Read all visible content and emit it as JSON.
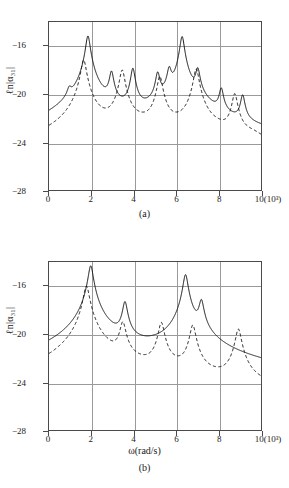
{
  "figure": {
    "ylabel": "ℓn|α₃₁|",
    "xlabel": "ω(rad/s)",
    "xtick_suffix": "(10³)"
  },
  "panels": [
    {
      "caption": "(a)",
      "show_xlabel": false
    },
    {
      "caption": "(b)",
      "show_xlabel": true
    }
  ],
  "axis": {
    "xticks": [
      "0",
      "2",
      "4",
      "6",
      "8",
      "10"
    ],
    "xtick_values": [
      0,
      2,
      4,
      6,
      8,
      10
    ],
    "yticks": [
      "−16",
      "−20",
      "−24",
      "−28"
    ],
    "ytick_values": [
      -16,
      -20,
      -24,
      -28
    ],
    "xlim": [
      0,
      10
    ],
    "ylim": [
      -28,
      -14.6
    ],
    "grid": true
  },
  "chart_data": {
    "type": "line",
    "title": "",
    "xlabel": "ω(rad/s)",
    "ylabel": "ℓn|α₃₁|",
    "xlim": [
      0,
      10
    ],
    "ylim": [
      -28,
      -14.6
    ],
    "x_unit_scale": "10^3",
    "grid": true,
    "legend": "none",
    "panels": [
      {
        "name": "(a)",
        "series": [
          {
            "name": "solid",
            "style": "solid",
            "baseline": -26.9,
            "baseline_right": -25.6,
            "peaks": [
              {
                "x": 0.95,
                "y": -20.5,
                "width": 0.1
              },
              {
                "x": 1.82,
                "y": -15.7,
                "width": 0.09
              },
              {
                "x": 2.92,
                "y": -18.6,
                "width": 0.09
              },
              {
                "x": 3.92,
                "y": -18.3,
                "width": 0.09
              },
              {
                "x": 5.08,
                "y": -18.7,
                "width": 0.09
              },
              {
                "x": 5.62,
                "y": -18.4,
                "width": 0.09
              },
              {
                "x": 6.22,
                "y": -15.75,
                "width": 0.09
              },
              {
                "x": 6.95,
                "y": -18.4,
                "width": 0.09
              },
              {
                "x": 8.05,
                "y": -20.0,
                "width": 0.09
              },
              {
                "x": 9.05,
                "y": -20.5,
                "width": 0.09
              }
            ],
            "valleys": [
              -24.2,
              -24.6,
              -24.1,
              -24.5,
              -24.3,
              -23.9,
              -24.2,
              -25.3,
              -26.2
            ]
          },
          {
            "name": "dashed",
            "style": "dashed",
            "baseline": -25.4,
            "baseline_right": -25.9,
            "peaks": [
              {
                "x": 1.62,
                "y": -17.6,
                "width": 0.11
              },
              {
                "x": 3.42,
                "y": -18.4,
                "width": 0.11
              },
              {
                "x": 5.18,
                "y": -18.9,
                "width": 0.11
              },
              {
                "x": 6.88,
                "y": -18.3,
                "width": 0.11
              },
              {
                "x": 8.68,
                "y": -20.3,
                "width": 0.11
              }
            ],
            "valleys": [
              -24.1,
              -23.4,
              -23.6,
              -23.8,
              -24.0
            ]
          }
        ]
      },
      {
        "name": "(b)",
        "series": [
          {
            "name": "solid",
            "style": "solid",
            "baseline": -24.3,
            "baseline_right": -25.0,
            "peaks": [
              {
                "x": 1.95,
                "y": -14.9,
                "width": 0.1
              },
              {
                "x": 3.55,
                "y": -17.8,
                "width": 0.1
              },
              {
                "x": 6.38,
                "y": -15.6,
                "width": 0.1
              },
              {
                "x": 7.12,
                "y": -17.7,
                "width": 0.1
              }
            ],
            "valleys": [
              -22.7,
              -22.6,
              -21.5,
              -25.0
            ]
          },
          {
            "name": "dashed",
            "style": "dashed",
            "baseline": -25.7,
            "baseline_right": -26.1,
            "peaks": [
              {
                "x": 1.75,
                "y": -16.5,
                "width": 0.12
              },
              {
                "x": 3.45,
                "y": -19.4,
                "width": 0.12
              },
              {
                "x": 5.25,
                "y": -19.4,
                "width": 0.12
              },
              {
                "x": 6.72,
                "y": -19.6,
                "width": 0.12
              },
              {
                "x": 8.85,
                "y": -19.9,
                "width": 0.12
              }
            ],
            "valleys": [
              -24.3,
              -24.4,
              -24.0,
              -25.1,
              -26.1
            ]
          }
        ]
      }
    ]
  }
}
